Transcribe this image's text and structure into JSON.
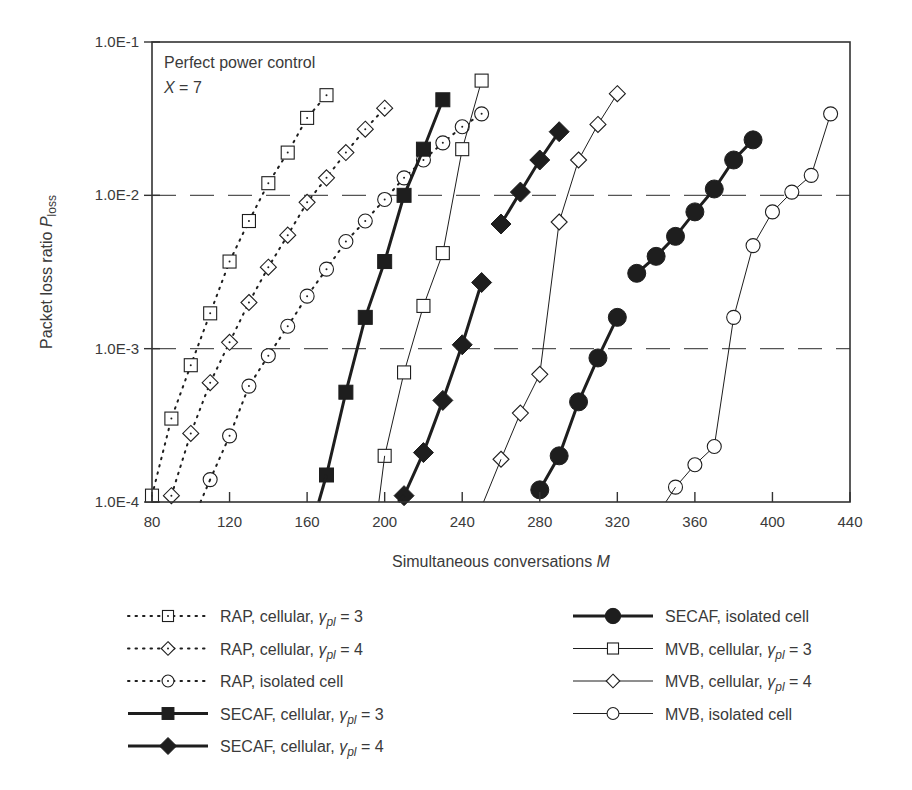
{
  "chart_data": {
    "type": "line",
    "yscale": "log",
    "title": "",
    "annotations": [
      "Perfect power control",
      "X = 7"
    ],
    "xlabel": "Simultaneous conversations M",
    "ylabel": "Packet loss ratio P_loss",
    "xlim": [
      80,
      440
    ],
    "ylim": [
      0.0001,
      0.1
    ],
    "xticks": [
      80,
      120,
      160,
      200,
      240,
      280,
      320,
      360,
      400,
      440
    ],
    "yticks": [
      0.0001,
      0.001,
      0.01,
      0.1
    ],
    "ytick_labels": [
      "1.0E-4",
      "1.0E-3",
      "1.0E-2",
      "1.0E-1"
    ],
    "grid": {
      "horizontal_dashed_at": [
        0.001,
        0.01
      ]
    },
    "legend_position": "below plot, two columns",
    "series": [
      {
        "name": "RAP, cellular, γpl = 3",
        "style": "dotted",
        "marker": "square-open",
        "x": [
          80,
          90,
          100,
          110,
          120,
          130,
          140,
          150,
          160,
          170
        ],
        "y": [
          0.00011,
          0.00035,
          0.00078,
          0.0017,
          0.0037,
          0.0068,
          0.012,
          0.019,
          0.032,
          0.045
        ]
      },
      {
        "name": "RAP, cellular, γpl = 4",
        "style": "dotted",
        "marker": "diamond-open",
        "x": [
          90,
          100,
          110,
          120,
          130,
          140,
          150,
          160,
          170,
          180,
          190,
          200
        ],
        "y": [
          0.00011,
          0.00028,
          0.0006,
          0.0011,
          0.002,
          0.0034,
          0.0055,
          0.009,
          0.013,
          0.019,
          0.027,
          0.037
        ]
      },
      {
        "name": "RAP, isolated cell",
        "style": "dotted",
        "marker": "circle-open",
        "x": [
          110,
          120,
          130,
          140,
          150,
          160,
          170,
          180,
          190,
          200,
          210,
          220,
          230,
          240,
          250
        ],
        "y": [
          0.00014,
          0.00027,
          0.00057,
          0.0009,
          0.0014,
          0.0022,
          0.0033,
          0.005,
          0.0068,
          0.0094,
          0.013,
          0.017,
          0.022,
          0.028,
          0.034
        ]
      },
      {
        "name": "SECAF, cellular, γpl = 3",
        "style": "solid-thick",
        "marker": "square-filled",
        "x": [
          170,
          180,
          190,
          200,
          210,
          220,
          230
        ],
        "y": [
          0.00015,
          0.00052,
          0.0016,
          0.0037,
          0.01,
          0.02,
          0.042
        ]
      },
      {
        "name": "SECAF, cellular, γpl = 4",
        "style": "solid-thick",
        "marker": "diamond-filled",
        "segments": [
          {
            "x": [
              210,
              220,
              230,
              240,
              250
            ],
            "y": [
              0.00011,
              0.00021,
              0.00046,
              0.00106,
              0.0027
            ]
          },
          {
            "x": [
              260,
              270,
              280,
              290
            ],
            "y": [
              0.0065,
              0.0105,
              0.017,
              0.026
            ]
          }
        ]
      },
      {
        "name": "SECAF, isolated cell",
        "style": "solid-thick",
        "marker": "circle-filled",
        "segments": [
          {
            "x": [
              280,
              290,
              300,
              310,
              320
            ],
            "y": [
              0.00012,
              0.0002,
              0.00045,
              0.00087,
              0.0016
            ]
          },
          {
            "x": [
              330,
              340,
              350,
              360,
              370,
              380,
              390
            ],
            "y": [
              0.0031,
              0.004,
              0.0054,
              0.0078,
              0.011,
              0.017,
              0.023
            ]
          }
        ]
      },
      {
        "name": "MVB, cellular, γpl = 3",
        "style": "solid-thin",
        "marker": "square-open",
        "x": [
          200,
          210,
          220,
          230,
          240,
          250
        ],
        "y": [
          0.0002,
          0.0007,
          0.0019,
          0.0042,
          0.02,
          0.056
        ]
      },
      {
        "name": "MVB, cellular, γpl = 4",
        "style": "solid-thin",
        "marker": "diamond-open",
        "x": [
          260,
          270,
          280,
          290,
          300,
          310,
          320
        ],
        "y": [
          0.00019,
          0.00038,
          0.00068,
          0.0067,
          0.017,
          0.029,
          0.046
        ]
      },
      {
        "name": "MVB, isolated cell",
        "style": "solid-thin",
        "marker": "circle-open",
        "x": [
          350,
          360,
          370,
          380,
          390,
          400,
          410,
          420,
          430
        ],
        "y": [
          0.000125,
          0.000175,
          0.00023,
          0.0016,
          0.0047,
          0.0078,
          0.0105,
          0.0135,
          0.034
        ]
      }
    ]
  },
  "axes": {
    "xlabel_text": "Simultaneous conversations ",
    "xlabel_var": "M",
    "ylabel_text": "Packet loss ratio ",
    "ylabel_var": "P",
    "ylabel_sub": "loss"
  },
  "annotation": {
    "line1": "Perfect power control",
    "line2_var": "X",
    "line2_rest": " = 7"
  },
  "legend": {
    "left": [
      {
        "prefix": "RAP, cellular, ",
        "sym": "γ",
        "sub": "pl",
        "suffix": " = 3"
      },
      {
        "prefix": "RAP, cellular, ",
        "sym": "γ",
        "sub": "pl",
        "suffix": " = 4"
      },
      {
        "prefix": "RAP, isolated cell",
        "sym": "",
        "sub": "",
        "suffix": ""
      },
      {
        "prefix": "SECAF, cellular, ",
        "sym": "γ",
        "sub": "pl",
        "suffix": " = 3"
      },
      {
        "prefix": "SECAF, cellular, ",
        "sym": "γ",
        "sub": "pl",
        "suffix": " = 4"
      }
    ],
    "right": [
      {
        "prefix": "SECAF, isolated cell",
        "sym": "",
        "sub": "",
        "suffix": ""
      },
      {
        "prefix": "MVB, cellular, ",
        "sym": "γ",
        "sub": "pl",
        "suffix": " = 3"
      },
      {
        "prefix": "MVB, cellular, ",
        "sym": "γ",
        "sub": "pl",
        "suffix": " = 4"
      },
      {
        "prefix": "MVB, isolated cell",
        "sym": "",
        "sub": "",
        "suffix": ""
      }
    ]
  },
  "colors": {
    "ink": "#1e1e1e",
    "text": "#3a3a3a",
    "grid": "#555555"
  }
}
